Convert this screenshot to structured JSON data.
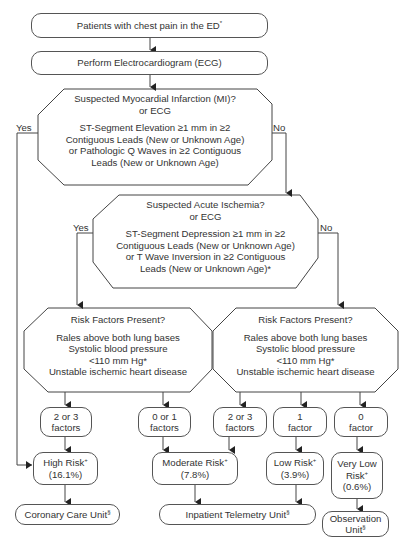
{
  "diagram": {
    "start": {
      "text": "Patients with chest pain in the ED",
      "mark": "*"
    },
    "ecg": {
      "text": "Perform Electrocardiogram (ECG)"
    },
    "mi_decision": {
      "title": "Suspected Myocardial Infarction (MI)?",
      "or": "or ECG",
      "lines": [
        "ST-Segment Elevation ≥1 mm in  ≥2",
        "Contiguous Leads (New or Unknown Age)",
        "or Pathologic Q Waves in ≥2 Contiguous",
        "Leads (New or Unknown Age)"
      ],
      "yes": "Yes",
      "no": "No"
    },
    "ischemia_decision": {
      "title": "Suspected Acute Ischemia?",
      "or": "or ECG",
      "lines": [
        "ST-Segment Depression ≥1 mm in  ≥2",
        "Contiguous Leads (New or Unknown Age)",
        "or T Wave Inversion in ≥2 Contiguous",
        "Leads (New or Unknown Age)*"
      ],
      "yes": "Yes",
      "no": "No"
    },
    "risk_left": {
      "title": "Risk Factors Present?",
      "lines": [
        "Rales above both lung bases",
        "Systolic blood pressure",
        "<110 mm Hg*",
        "Unstable ischemic heart disease"
      ]
    },
    "risk_right": {
      "title": "Risk Factors Present?",
      "lines": [
        "Rales above both lung bases",
        "Systolic blood pressure",
        "<110 mm Hg*",
        "Unstable ischemic heart disease"
      ]
    },
    "factors": [
      {
        "line1": "2 or 3",
        "line2": "factors"
      },
      {
        "line1": "0 or 1",
        "line2": "factors"
      },
      {
        "line1": "2 or 3",
        "line2": "factors"
      },
      {
        "line1": "1",
        "line2": "factor"
      },
      {
        "line1": "0",
        "line2": "factor"
      }
    ],
    "risks": [
      {
        "label": "High Risk",
        "mark": "+",
        "pct": "(16.1%)"
      },
      {
        "label": "Moderate Risk",
        "mark": "+",
        "pct": "(7.8%)"
      },
      {
        "label": "Low Risk",
        "mark": "+",
        "pct": "(3.9%)"
      },
      {
        "label1": "Very Low",
        "label2": "Risk",
        "mark": "+",
        "pct": "(0.6%)"
      }
    ],
    "destinations": [
      {
        "label": "Coronary Care Unit",
        "mark": "§"
      },
      {
        "label": "Inpatient Telemetry Unit",
        "mark": "§"
      },
      {
        "label1": "Observation",
        "label2": "Unit",
        "mark": "§"
      }
    ]
  }
}
